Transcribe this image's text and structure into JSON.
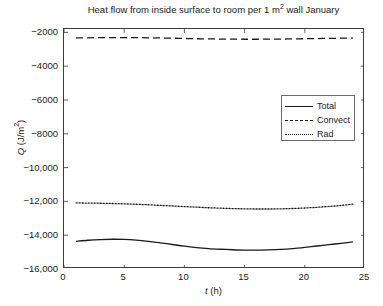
{
  "chart_data": {
    "type": "line",
    "title_main": "Heat flow from inside surface to room per 1 m",
    "title_sup": "2",
    "title_tail": "  wall January",
    "xlabel_var": "t",
    "xlabel_unit": " (h)",
    "ylabel_var": "Q",
    "ylabel_unit": " (J/m",
    "ylabel_sup": "2",
    "ylabel_tail": ")",
    "xlim": [
      0,
      25
    ],
    "ylim": [
      -16000,
      -1800
    ],
    "xticks": [
      0,
      5,
      10,
      15,
      20,
      25
    ],
    "xtick_labels": [
      "0",
      "5",
      "10",
      "15",
      "20",
      "25"
    ],
    "yticks": [
      -2000,
      -4000,
      -6000,
      -8000,
      -10000,
      -12000,
      -14000,
      -16000
    ],
    "ytick_labels": [
      "−2000",
      "−4000",
      "−6000",
      "−8000",
      "−10,000",
      "−12,000",
      "−14,000",
      "−16,000"
    ],
    "grid": false,
    "legend_position": "upper right",
    "line_color": "#1a1a1a",
    "axis_color": "#3c3c3c",
    "background": "#ffffff",
    "x": [
      1,
      2,
      3,
      4,
      5,
      6,
      7,
      8,
      9,
      10,
      11,
      12,
      13,
      14,
      15,
      16,
      17,
      18,
      19,
      20,
      21,
      22,
      23,
      24
    ],
    "series": [
      {
        "name": "Total",
        "style": "solid",
        "values": [
          -14360,
          -14300,
          -14260,
          -14240,
          -14250,
          -14290,
          -14360,
          -14450,
          -14550,
          -14650,
          -14730,
          -14790,
          -14830,
          -14860,
          -14880,
          -14880,
          -14870,
          -14840,
          -14790,
          -14720,
          -14640,
          -14560,
          -14480,
          -14400
        ]
      },
      {
        "name": "Convect",
        "style": "dashed",
        "values": [
          -2330,
          -2320,
          -2310,
          -2305,
          -2305,
          -2310,
          -2320,
          -2330,
          -2345,
          -2360,
          -2375,
          -2385,
          -2395,
          -2400,
          -2405,
          -2405,
          -2400,
          -2395,
          -2385,
          -2375,
          -2365,
          -2355,
          -2345,
          -2335
        ]
      },
      {
        "name": "Rad",
        "style": "dotted",
        "values": [
          -12090,
          -12100,
          -12110,
          -12125,
          -12145,
          -12170,
          -12200,
          -12235,
          -12270,
          -12305,
          -12340,
          -12375,
          -12400,
          -12425,
          -12440,
          -12450,
          -12450,
          -12440,
          -12420,
          -12390,
          -12350,
          -12300,
          -12240,
          -12160
        ]
      }
    ],
    "legend": [
      {
        "label": "Total",
        "style": "solid"
      },
      {
        "label": "Convect",
        "style": "dashed"
      },
      {
        "label": "Rad",
        "style": "dotted"
      }
    ]
  }
}
